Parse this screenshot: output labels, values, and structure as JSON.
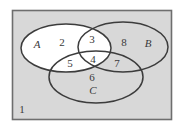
{
  "figure": {
    "type": "venn-diagram",
    "set_count": 3,
    "universe_label": "1",
    "colors": {
      "page_background": "#ffffff",
      "universe_fill": "#d8d8d8",
      "universe_border": "#6e6e6e",
      "ellipse_stroke": "#3c3c3c",
      "highlight_fill": "#ffffff",
      "label_color": "#3a3a3a"
    },
    "frame": {
      "x": 12,
      "y": 10,
      "width": 160,
      "height": 110
    }
  },
  "sets": [
    {
      "id": "A",
      "label": "A",
      "label_x": 37,
      "label_y": 45,
      "cx": 66,
      "cy": 48,
      "rx": 45,
      "ry": 24,
      "filled": true
    },
    {
      "id": "B",
      "label": "B",
      "label_x": 148,
      "label_y": 44,
      "cx": 123,
      "cy": 47,
      "rx": 45,
      "ry": 25,
      "filled": false
    },
    {
      "id": "C",
      "label": "C",
      "label_x": 93,
      "label_y": 91,
      "cx": 96,
      "cy": 77,
      "rx": 47,
      "ry": 26,
      "filled": false
    }
  ],
  "regions": [
    {
      "id": "universe-only",
      "label": "1",
      "x": 22,
      "y": 110,
      "description": "outside all sets",
      "shaded": false
    },
    {
      "id": "A-only",
      "label": "2",
      "x": 62,
      "y": 43,
      "description": "A only",
      "shaded": true
    },
    {
      "id": "A-and-B",
      "label": "3",
      "x": 92,
      "y": 40,
      "description": "A intersect B, not C",
      "shaded": false
    },
    {
      "id": "A-and-B-and-C",
      "label": "4",
      "x": 93,
      "y": 60,
      "description": "A intersect B intersect C",
      "shaded": true
    },
    {
      "id": "A-and-C",
      "label": "5",
      "x": 70,
      "y": 64,
      "description": "A intersect C, not B",
      "shaded": true
    },
    {
      "id": "C-only",
      "label": "6",
      "x": 92,
      "y": 78,
      "description": "C only",
      "shaded": false
    },
    {
      "id": "B-and-C",
      "label": "7",
      "x": 117,
      "y": 64,
      "description": "B intersect C, not A",
      "shaded": false
    },
    {
      "id": "B-only",
      "label": "8",
      "x": 124,
      "y": 43,
      "description": "B only",
      "shaded": false
    }
  ]
}
